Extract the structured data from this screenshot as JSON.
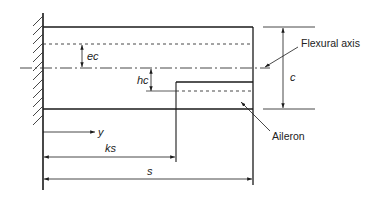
{
  "diagram": {
    "labels": {
      "ec": "ec",
      "hc": "hc",
      "c": "c",
      "y": "y",
      "ks": "ks",
      "s": "s",
      "flexural_axis": "Flexural axis",
      "aileron": "Aileron"
    },
    "colors": {
      "line": "#1a1a1a",
      "background": "#ffffff"
    }
  }
}
